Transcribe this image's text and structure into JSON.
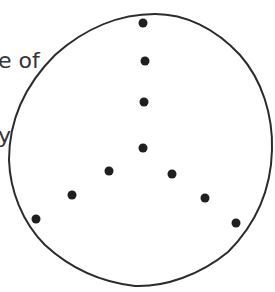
{
  "caption": {
    "lines": [
      "e of",
      "y"
    ]
  },
  "figure": {
    "outline_color": "#2b2b2b",
    "dot_color": "#1f1f1f",
    "dot_radius": 4.5,
    "dots": [
      {
        "x": 143,
        "y": 23
      },
      {
        "x": 145,
        "y": 61
      },
      {
        "x": 144,
        "y": 102
      },
      {
        "x": 143,
        "y": 148
      },
      {
        "x": 109,
        "y": 171
      },
      {
        "x": 72,
        "y": 195
      },
      {
        "x": 36,
        "y": 219
      },
      {
        "x": 172,
        "y": 174
      },
      {
        "x": 205,
        "y": 198
      },
      {
        "x": 236,
        "y": 223
      }
    ]
  }
}
